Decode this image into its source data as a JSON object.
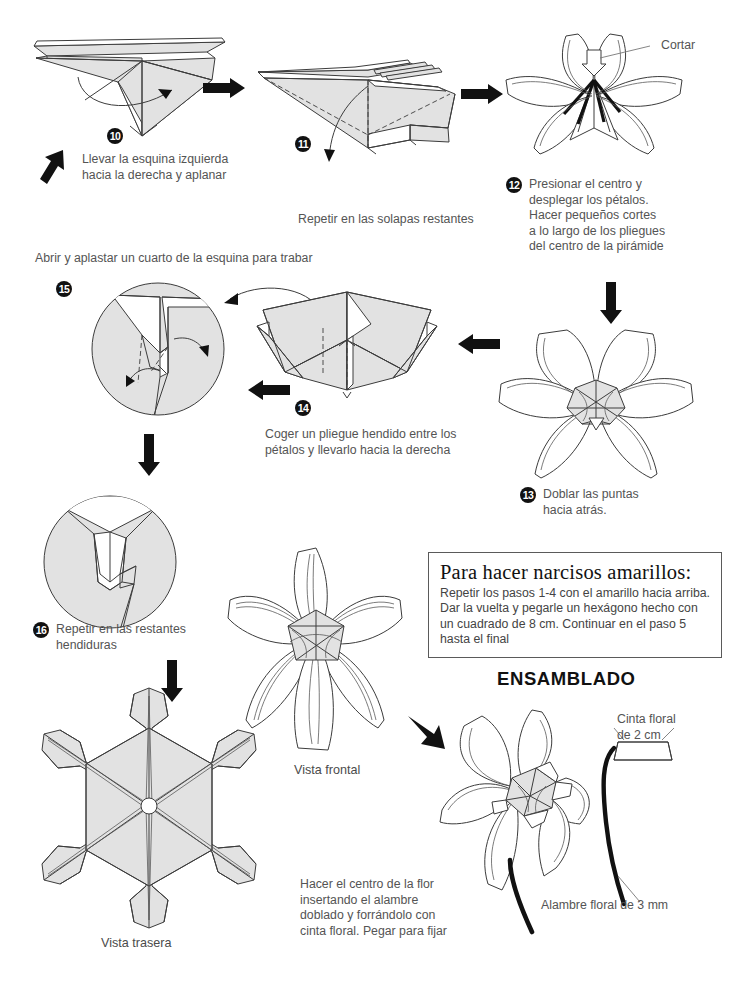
{
  "document": {
    "title": "Instrucciones de origami - flor de narciso",
    "language": "es"
  },
  "steps": [
    {
      "id": "step-10",
      "number": "10",
      "caption": "Llevar la esquina izquierda\nhacia la derecha y aplanar"
    },
    {
      "id": "step-11",
      "number": "11",
      "caption": "Repetir en las solapas restantes"
    },
    {
      "id": "step-12",
      "number": "12",
      "caption": "Presionar el centro y\ndesplegar los pétalos.\nHacer pequeños cortes\na lo largo de los pliegues\ndel centro de la pirámide",
      "annotation": "Cortar"
    },
    {
      "id": "step-13",
      "number": "13",
      "caption": "Doblar las puntas\nhacia atrás."
    },
    {
      "id": "step-14",
      "number": "14",
      "caption": "Coger un pliegue hendido entre los\npétalos y llevarlo hacia la derecha"
    },
    {
      "id": "step-15",
      "number": "15",
      "caption": "Abrir y aplastar un cuarto de la esquina para trabar"
    },
    {
      "id": "step-16",
      "number": "16",
      "caption": "Repetir en las restantes\nhendiduras"
    }
  ],
  "views": {
    "front_label": "Vista frontal",
    "back_label": "Vista trasera"
  },
  "yellow_box": {
    "heading": "Para hacer narcisos amarillos:",
    "body": "Repetir los pasos 1-4 con el amarillo hacia arriba. Dar la vuelta y pegarle un hexágono hecho con un cuadrado de 8 cm. Continuar en el paso 5 hasta el final"
  },
  "assembly": {
    "heading": "ENSAMBLADO",
    "caption": "Hacer el centro de la flor\ninsertando el alambre\ndoblado y forrándolo con\ncinta floral. Pegar para fijar",
    "tape_label": "Cinta floral\nde 2 cm",
    "wire_label": "Alambre floral de 3 mm"
  },
  "colors": {
    "paper_fill": "#e2e2e2",
    "paper_white": "#ffffff",
    "line": "#3c3c3c",
    "text": "#545454",
    "ink": "#111111"
  },
  "icons": {
    "arrow_right": "arrow-right-icon",
    "arrow_down": "arrow-down-icon",
    "arrow_left": "arrow-left-icon",
    "arrow_up_left": "arrow-up-left-icon",
    "arrow_diag": "arrow-diagonal-icon",
    "curved_arrow": "curved-arrow-icon",
    "push_arrow": "push-arrow-icon"
  }
}
